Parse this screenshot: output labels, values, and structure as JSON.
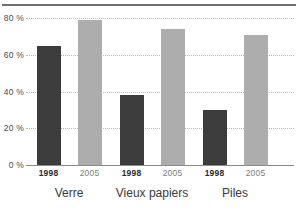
{
  "chart_data": {
    "type": "bar",
    "title": "",
    "xlabel": "",
    "ylabel": "",
    "ylim": [
      0,
      80
    ],
    "yticks": [
      0,
      20,
      40,
      60,
      80
    ],
    "ytick_labels": [
      "0 %",
      "20 %",
      "40 %",
      "60 %",
      "80 %"
    ],
    "grid": true,
    "legend": "none",
    "categories": [
      "Verre",
      "Vieux papiers",
      "Piles"
    ],
    "series": [
      {
        "name": "1998",
        "values": [
          65,
          38,
          30
        ],
        "color": "#3c3c3c"
      },
      {
        "name": "2005",
        "values": [
          79,
          74,
          71
        ],
        "color": "#adadad"
      }
    ],
    "bars": [
      {
        "group": "Verre",
        "year": "1998",
        "value": 65,
        "series_index": 0
      },
      {
        "group": "Verre",
        "year": "2005",
        "value": 79,
        "series_index": 1
      },
      {
        "group": "Vieux papiers",
        "year": "1998",
        "value": 38,
        "series_index": 0
      },
      {
        "group": "Vieux papiers",
        "year": "2005",
        "value": 74,
        "series_index": 1
      },
      {
        "group": "Piles",
        "year": "1998",
        "value": 30,
        "series_index": 0
      },
      {
        "group": "Piles",
        "year": "2005",
        "value": 71,
        "series_index": 1
      }
    ]
  },
  "axis": {
    "y_labels": [
      "80 %",
      "60 %",
      "40 %",
      "20 %",
      "0 %"
    ],
    "y_values": [
      80,
      60,
      40,
      20,
      0
    ]
  },
  "x_axis": {
    "year_labels": [
      "1998",
      "2005",
      "1998",
      "2005",
      "1998",
      "2005"
    ],
    "group_labels": [
      "Verre",
      "Vieux papiers",
      "Piles"
    ]
  },
  "colors": {
    "series_1998": "#3c3c3c",
    "series_2005": "#adadad",
    "gridline": "#b9b9b9",
    "axis": "#8a8a8a",
    "top_rule": "#6f6f6f",
    "tick_text": "#4a4a4a",
    "group_text": "#3a3a3a"
  }
}
